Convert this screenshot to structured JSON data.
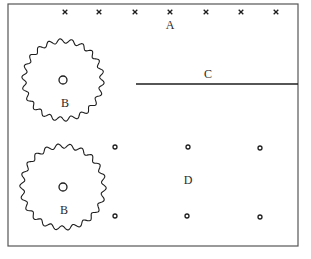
{
  "diagram": {
    "frame": {
      "x": 8,
      "y": 4,
      "width": 290,
      "height": 242,
      "stroke": "#555555"
    },
    "region_a": {
      "label": "A",
      "label_pos": [
        170,
        29
      ],
      "marker_icon": "x-mark",
      "markers": [
        [
          65,
          12
        ],
        [
          99,
          12
        ],
        [
          135,
          12
        ],
        [
          170,
          12
        ],
        [
          206,
          12
        ],
        [
          241,
          12
        ],
        [
          276,
          12
        ]
      ]
    },
    "region_b": [
      {
        "label": "B",
        "center": [
          63,
          80
        ],
        "radius": 39,
        "inner_radius": 4,
        "label_pos": [
          65,
          107
        ]
      },
      {
        "label": "B",
        "center": [
          63,
          187
        ],
        "radius": 41,
        "inner_radius": 4,
        "label_pos": [
          64,
          214
        ]
      }
    ],
    "region_c": {
      "label": "C",
      "label_pos": [
        208,
        78
      ],
      "line": {
        "x1": 136,
        "y1": 84,
        "x2": 298,
        "y2": 84
      }
    },
    "region_d": {
      "label": "D",
      "label_pos": [
        188,
        184
      ],
      "dots": [
        [
          115,
          147
        ],
        [
          188,
          147
        ],
        [
          260,
          148
        ],
        [
          115,
          216
        ],
        [
          187,
          216
        ],
        [
          260,
          217
        ]
      ]
    },
    "colors": {
      "ink": "#1e1e1e",
      "background": "#ffffff"
    }
  }
}
